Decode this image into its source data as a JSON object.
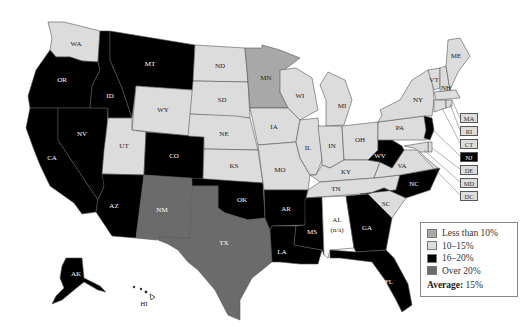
{
  "title": "",
  "colors": {
    "less_than_10": "#a8a8a8",
    "10_15": "#dcdcdc",
    "16_20": "#000000",
    "over_20": "#6b6b6b",
    "na": "#ffffff"
  },
  "legend": {
    "items": [
      {
        "label": "Less than 10%",
        "category": "less_than_10"
      },
      {
        "label": "10–15%",
        "category": "10_15"
      },
      {
        "label": "16–20%",
        "category": "16_20"
      },
      {
        "label": "Over 20%",
        "category": "over_20"
      }
    ],
    "average_label": "Average:",
    "average_value": "15%"
  },
  "states": {
    "WA": {
      "label": "WA",
      "category": "10_15"
    },
    "OR": {
      "label": "OR",
      "category": "16_20"
    },
    "CA": {
      "label": "CA",
      "category": "16_20"
    },
    "ID": {
      "label": "ID",
      "category": "16_20"
    },
    "NV": {
      "label": "NV",
      "category": "16_20"
    },
    "MT": {
      "label": "MT",
      "category": "16_20"
    },
    "WY": {
      "label": "WY",
      "category": "10_15"
    },
    "UT": {
      "label": "UT",
      "category": "10_15"
    },
    "CO": {
      "label": "CO",
      "category": "16_20"
    },
    "AZ": {
      "label": "AZ",
      "category": "16_20"
    },
    "NM": {
      "label": "NM",
      "category": "over_20"
    },
    "ND": {
      "label": "ND",
      "category": "10_15"
    },
    "SD": {
      "label": "SD",
      "category": "10_15"
    },
    "NE": {
      "label": "NE",
      "category": "10_15"
    },
    "KS": {
      "label": "KS",
      "category": "10_15"
    },
    "OK": {
      "label": "OK",
      "category": "16_20"
    },
    "TX": {
      "label": "TX",
      "category": "over_20"
    },
    "MN": {
      "label": "MN",
      "category": "less_than_10"
    },
    "IA": {
      "label": "IA",
      "category": "10_15"
    },
    "MO": {
      "label": "MO",
      "category": "10_15"
    },
    "AR": {
      "label": "AR",
      "category": "16_20"
    },
    "LA": {
      "label": "LA",
      "category": "16_20"
    },
    "WI": {
      "label": "WI",
      "category": "10_15"
    },
    "IL": {
      "label": "IL",
      "category": "10_15"
    },
    "MI": {
      "label": "MI",
      "category": "10_15"
    },
    "IN": {
      "label": "IN",
      "category": "10_15"
    },
    "OH": {
      "label": "OH",
      "category": "10_15"
    },
    "KY": {
      "label": "KY",
      "category": "10_15"
    },
    "TN": {
      "label": "TN",
      "category": "10_15"
    },
    "MS": {
      "label": "MS",
      "category": "16_20"
    },
    "AL": {
      "label": "AL",
      "sublabel": "(n/a)",
      "category": "na"
    },
    "GA": {
      "label": "GA",
      "category": "16_20"
    },
    "FL": {
      "label": "FL",
      "category": "16_20"
    },
    "SC": {
      "label": "SC",
      "category": "10_15"
    },
    "NC": {
      "label": "NC",
      "category": "16_20"
    },
    "VA": {
      "label": "VA",
      "category": "10_15"
    },
    "WV": {
      "label": "WV",
      "category": "16_20"
    },
    "PA": {
      "label": "PA",
      "category": "10_15"
    },
    "NY": {
      "label": "NY",
      "category": "10_15"
    },
    "VT": {
      "label": "VT",
      "category": "10_15"
    },
    "NH": {
      "label": "NH",
      "category": "10_15"
    },
    "ME": {
      "label": "ME",
      "category": "10_15"
    },
    "MA": {
      "label": "MA",
      "category": "10_15"
    },
    "RI": {
      "label": "RI",
      "category": "10_15"
    },
    "CT": {
      "label": "CT",
      "category": "10_15"
    },
    "NJ": {
      "label": "NJ",
      "category": "16_20"
    },
    "DE": {
      "label": "DE",
      "category": "10_15"
    },
    "MD": {
      "label": "MD",
      "category": "10_15"
    },
    "DC": {
      "label": "DC",
      "category": "10_15"
    },
    "AK": {
      "label": "AK",
      "category": "16_20"
    },
    "HI": {
      "label": "HI",
      "category": "na"
    }
  },
  "callouts": [
    "MA",
    "RI",
    "CT",
    "NJ",
    "DE",
    "MD",
    "DC"
  ]
}
